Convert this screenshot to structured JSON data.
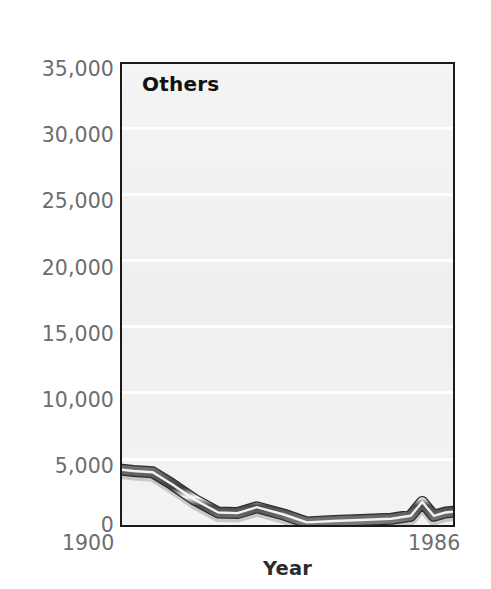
{
  "chart_data": {
    "type": "line",
    "title": "Others",
    "xlabel": "Year",
    "ylabel": "",
    "xlim": [
      1900,
      1986
    ],
    "ylim": [
      0,
      35000
    ],
    "grid": true,
    "legend_position": "none",
    "x_tick_labels": [
      "1900",
      "1986"
    ],
    "y_tick_labels": [
      "0",
      "5,000",
      "10,000",
      "15,000",
      "20,000",
      "25,000",
      "30,000",
      "35,000"
    ],
    "y_ticks": [
      0,
      5000,
      10000,
      15000,
      20000,
      25000,
      30000,
      35000
    ],
    "series": [
      {
        "name": "Others",
        "color": "#4a4a4a",
        "x": [
          1900,
          1903,
          1908,
          1913,
          1919,
          1925,
          1930,
          1935,
          1942,
          1948,
          1955,
          1962,
          1970,
          1975,
          1978,
          1981,
          1984,
          1986
        ],
        "values": [
          4200,
          4100,
          4000,
          3100,
          1900,
          950,
          900,
          1350,
          800,
          200,
          300,
          380,
          470,
          700,
          1750,
          700,
          950,
          1000
        ]
      }
    ]
  },
  "axes": {
    "y_tick_labels": [
      "35,000",
      "30,000",
      "25,000",
      "20,000",
      "15,000",
      "10,000",
      "5,000",
      "0"
    ],
    "x_tick_left": "1900",
    "x_tick_right": "1986",
    "x_axis_title": "Year"
  },
  "panel": {
    "title": "Others"
  },
  "colors": {
    "plot_background": "#f2f2f2",
    "plot_border": "#1a1a1a",
    "gridline": "#ffffff",
    "tick_label": "#6d6d6d",
    "axis_title": "#2b2b2b",
    "series_line": "#4a4a4a",
    "series_line_highlight": "#f7f7f7",
    "page_background": "#ffffff"
  }
}
